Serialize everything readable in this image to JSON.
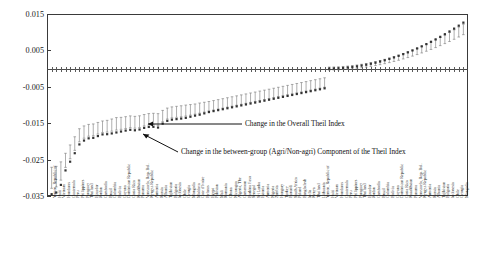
{
  "chart_data": {
    "type": "scatter",
    "title": "",
    "xlabel": "",
    "ylabel": "",
    "ylim": [
      -0.035,
      0.015
    ],
    "yticks": [
      0.015,
      0.005,
      -0.005,
      -0.015,
      -0.025,
      -0.035
    ],
    "ytick_labels": [
      "0.015",
      "0.005",
      "-0.005",
      "-0.015",
      "-0.025",
      "-0.035"
    ],
    "grid": false,
    "legend_position": "none",
    "zero_line": 0.0,
    "annotations": [
      {
        "id": "overall",
        "text": "Change in the Overall Theil Index"
      },
      {
        "id": "between",
        "text": "Change in the between-group (Agri/Non-agri) Component of the Theil Index"
      }
    ],
    "series": [
      {
        "name": "Change in the Overall Theil Index",
        "marker": "square",
        "color": "#333333"
      },
      {
        "name": "Change in the between-group (Agri/Non-agri) Component of the Theil Index",
        "marker": "error-bar",
        "color": "#777777"
      }
    ],
    "categories": [
      "Yemen, Republic of",
      "Haiti",
      "Vietnam",
      "Honduras",
      "Guatemala",
      "Peru",
      "Philippines",
      "Paraguay",
      "Thailand",
      "Ecuador",
      "Jordan",
      "Cambodia",
      "Brazil",
      "Colombia",
      "Bolivia",
      "Guyana",
      "Dominican Republic",
      "Costa Rica",
      "Kazakhstan",
      "Panama",
      "Venezuela, Rep. Bol.",
      "Kyrgyz Republic",
      "Armenia",
      "Russia",
      "Albania",
      "Tajikistan",
      "Bulgaria",
      "Indonesia",
      "Chile",
      "Georgia",
      "Mongolia",
      "Moldova",
      "Cote d'Ivoire",
      "Belarus",
      "Egypt",
      "Pakistan",
      "Mali",
      "Romania",
      "Ghana",
      "Nicaragua",
      "Algeria, The",
      "Cameroon",
      "Burkina Faso",
      "Senegal",
      "Sri Lanka",
      "Estonia",
      "Armenia",
      "Nigeria",
      "Zambia",
      "Hungary",
      "Turkey",
      "Burundi",
      "South Africa",
      "Poland",
      "Bangladesh",
      "India",
      "Kenya",
      "Thailand",
      "Lithuania"
    ],
    "overall_values": [
      -0.0345,
      -0.0338,
      -0.0277,
      -0.0242,
      -0.0205,
      -0.0192,
      -0.019,
      -0.0181,
      -0.018,
      -0.0176,
      -0.0172,
      -0.0168,
      -0.017,
      -0.0163,
      -0.0159,
      -0.0162,
      -0.0145,
      -0.014,
      -0.0138,
      -0.0135,
      -0.013,
      -0.0126,
      -0.012,
      -0.0116,
      -0.0112,
      -0.0108,
      -0.0104,
      -0.01,
      -0.0096,
      -0.0092,
      -0.0088,
      -0.0084,
      -0.008,
      -0.0076,
      -0.0072,
      -0.0068,
      -0.0064,
      -0.006,
      -0.0056,
      -0.0052,
      -0.0048,
      -0.0044,
      -0.004,
      -0.0036,
      -0.0032,
      -0.0029,
      -0.0026,
      -0.0023,
      -0.002,
      -0.0018,
      -0.0015,
      -0.0013,
      -0.0011,
      -0.0009,
      -0.0007,
      -0.0005,
      -0.0003,
      -0.0002,
      -0.0001
    ],
    "between_values": [
      -0.03,
      -0.0295,
      -0.025,
      -0.0215,
      -0.018,
      -0.017,
      -0.0168,
      -0.016,
      -0.0158,
      -0.0152,
      -0.015,
      -0.0146,
      -0.0148,
      -0.0142,
      -0.0138,
      -0.014,
      -0.0125,
      -0.012,
      -0.0118,
      -0.0115,
      -0.0112,
      -0.0108,
      -0.0104,
      -0.01,
      -0.0096,
      -0.0092,
      -0.0088,
      -0.0084,
      -0.008,
      -0.0076,
      -0.0072,
      -0.0068,
      -0.0064,
      -0.006,
      -0.0056,
      -0.0052,
      -0.0048,
      -0.0044,
      -0.004,
      -0.0036,
      -0.0032,
      -0.0028,
      -0.0024,
      -0.0021,
      -0.0018,
      -0.0015,
      -0.0013,
      -0.0011,
      -0.0009,
      -0.0008,
      -0.0006,
      -0.0005,
      -0.0004,
      -0.0003,
      -0.0002,
      -0.0002,
      -0.0001,
      -0.0001,
      0.0
    ],
    "n_points": 90
  }
}
